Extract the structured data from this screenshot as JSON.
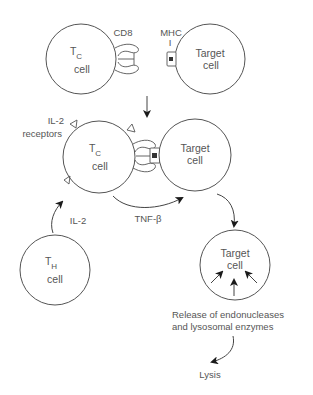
{
  "figure": {
    "top_row": {
      "tc_cell": {
        "main": "T",
        "sub": "C",
        "line2": "cell"
      },
      "target_cell": {
        "line1": "Target",
        "line2": "cell"
      },
      "cd8_label": "CD8",
      "mhc_label_line1": "MHC",
      "mhc_label_line2": "I"
    },
    "middle_row": {
      "il2_receptors_line1": "IL-2",
      "il2_receptors_line2": "receptors",
      "tc_cell": {
        "main": "T",
        "sub": "C",
        "line2": "cell"
      },
      "target_cell": {
        "line1": "Target",
        "line2": "cell"
      },
      "tnf_label": "TNF-β"
    },
    "bottom_row": {
      "th_cell": {
        "main": "T",
        "sub": "H",
        "line2": "cell"
      },
      "il2_label": "IL-2",
      "target_cell": {
        "line1": "Target",
        "line2": "cell"
      },
      "release_line1": "Release of endonucleases",
      "release_line2": "and lysosomal enzymes",
      "lysis_label": "Lysis"
    },
    "colors": {
      "stroke": "#555555",
      "arrow": "#1a1a1a",
      "text": "#555555",
      "background": "#ffffff"
    }
  }
}
